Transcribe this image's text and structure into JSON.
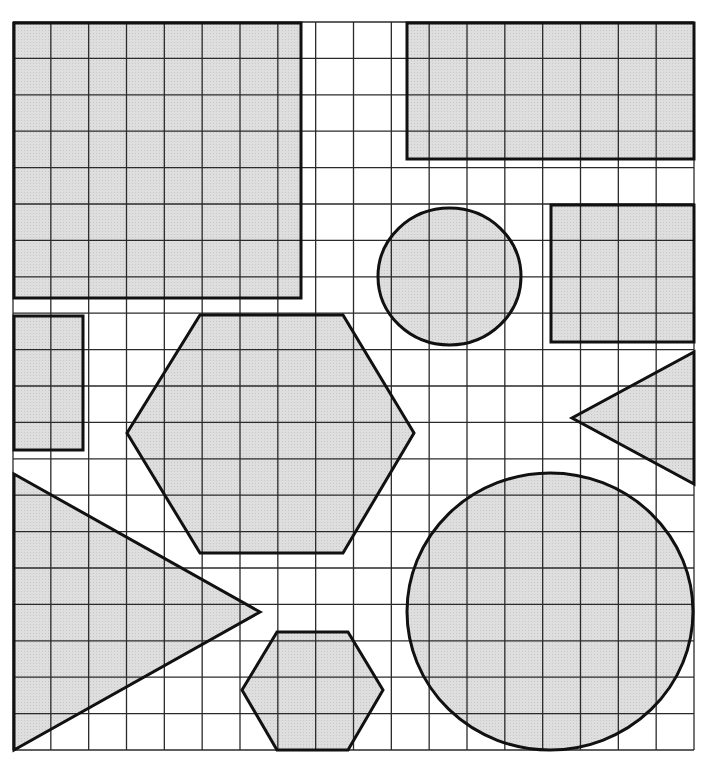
{
  "diagram": {
    "type": "shapes-on-grid",
    "grid": {
      "x0": 13,
      "y0": 22,
      "x1": 694,
      "y1": 750,
      "columns": 18,
      "rows": 20,
      "line_color": "#2a2a2a"
    },
    "style": {
      "fill_color": "#dedede",
      "fill_dot_color": "#c8c8c8",
      "stroke_color": "#111111",
      "background": "#ffffff"
    },
    "shapes": [
      {
        "id": "top-left-square",
        "kind": "rect",
        "x": 14,
        "y": 23,
        "w": 287,
        "h": 275
      },
      {
        "id": "top-right-rectangle",
        "kind": "rect",
        "x": 407,
        "y": 23,
        "w": 287,
        "h": 136
      },
      {
        "id": "small-circle",
        "kind": "ellipse",
        "cx": 449.5,
        "cy": 276.5,
        "rx": 71.5,
        "ry": 68.5
      },
      {
        "id": "right-rectangle",
        "kind": "rect",
        "x": 551,
        "y": 205,
        "w": 143,
        "h": 137
      },
      {
        "id": "left-small-rectangle",
        "kind": "rect",
        "x": 14,
        "y": 316,
        "w": 69,
        "h": 134
      },
      {
        "id": "large-hexagon",
        "kind": "polygon",
        "points": "200,315 343,315 414,433 343,553 200,553 127,433"
      },
      {
        "id": "right-triangle",
        "kind": "polygon",
        "points": "694,352 694,484 572,418"
      },
      {
        "id": "left-triangle",
        "kind": "polygon",
        "points": "14,474 260,612 14,750"
      },
      {
        "id": "large-circle",
        "kind": "ellipse",
        "cx": 550,
        "cy": 611.5,
        "rx": 143,
        "ry": 138.5
      },
      {
        "id": "small-hexagon",
        "kind": "polygon",
        "points": "277,632 348,632 383,690 348,750 277,750 242,690"
      }
    ]
  }
}
